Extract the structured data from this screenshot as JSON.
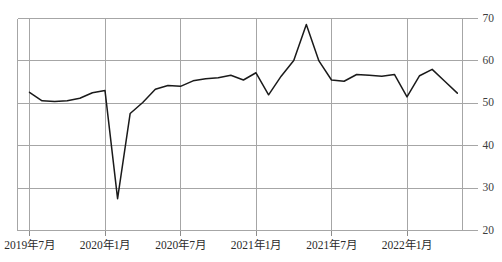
{
  "chart_data": {
    "type": "line",
    "title": "",
    "subtitle": "",
    "xlabel": "",
    "ylabel": "",
    "ylim": [
      20,
      70
    ],
    "y_ticks": [
      20,
      30,
      40,
      50,
      60,
      70
    ],
    "x_tick_labels": [
      "2019年7月",
      "2020年1月",
      "2020年7月",
      "2021年1月",
      "2021年7月",
      "2022年1月"
    ],
    "x_tick_indices": [
      0,
      6,
      12,
      18,
      24,
      30
    ],
    "grid": true,
    "grid_axes": "both",
    "legend": "none",
    "annotations": [],
    "series": [
      {
        "name": "series-1",
        "color": "#1a1a1a",
        "x": [
          "2019年7月",
          "2019年8月",
          "2019年9月",
          "2019年10月",
          "2019年11月",
          "2019年12月",
          "2020年1月",
          "2020年2月",
          "2020年3月",
          "2020年4月",
          "2020年5月",
          "2020年6月",
          "2020年7月",
          "2020年8月",
          "2020年9月",
          "2020年10月",
          "2020年11月",
          "2020年12月",
          "2021年1月",
          "2021年2月",
          "2021年3月",
          "2021年4月",
          "2021年5月",
          "2021年6月",
          "2021年7月",
          "2021年8月",
          "2021年9月",
          "2021年10月",
          "2021年11月",
          "2021年12月",
          "2022年1月",
          "2022年2月",
          "2022年3月",
          "2022年4月",
          "2022年5月"
        ],
        "values": [
          52.6,
          50.6,
          50.4,
          50.6,
          51.2,
          52.5,
          53.0,
          27.5,
          47.6,
          50.2,
          53.3,
          54.2,
          54.0,
          55.3,
          55.8,
          56.0,
          56.6,
          55.5,
          57.2,
          52.0,
          56.4,
          60.1,
          68.6,
          60.0,
          55.5,
          55.2,
          56.8,
          56.6,
          56.4,
          56.8,
          51.5,
          56.5,
          58.0,
          55.2,
          52.4
        ]
      }
    ]
  },
  "axis": {
    "y_label_suffix": "",
    "x_axis_name": "time-axis",
    "y_axis_name": "value-axis"
  }
}
